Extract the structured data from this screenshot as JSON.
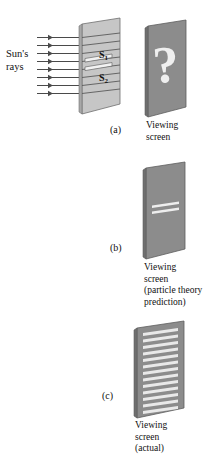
{
  "figure": {
    "colors": {
      "barrier_face": "#c6c6c6",
      "barrier_edge": "#8f8f8f",
      "screen_face": "#8c8c8c",
      "screen_side": "#6f6f6f",
      "band_light": "#e8e8e8",
      "ray_line": "#4a4a4a",
      "outline": "#555555",
      "background": "#ffffff",
      "text": "#111111"
    },
    "rays": {
      "count": 8,
      "label": "Sun's\nrays",
      "arrow_style": "short-tick-arrowhead"
    },
    "slits": {
      "upper_label": "S",
      "upper_subscript": "1",
      "lower_label": "S",
      "lower_subscript": "2",
      "count": 2
    },
    "panels": [
      {
        "id": "a",
        "letter": "(a)",
        "screen_marking": "question-mark",
        "caption": "Viewing\nscreen"
      },
      {
        "id": "b",
        "letter": "(b)",
        "screen_marking": "two-bright-bands",
        "band_count": 2,
        "caption": "Viewing\nscreen\n(particle theory\nprediction)"
      },
      {
        "id": "c",
        "letter": "(c)",
        "screen_marking": "many-interference-fringes",
        "band_count": 13,
        "caption": "Viewing\nscreen\n(actual)"
      }
    ],
    "question_mark_glyph": "?"
  }
}
